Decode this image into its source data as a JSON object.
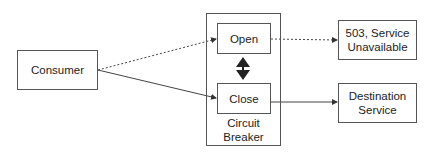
{
  "diagram": {
    "nodes": {
      "consumer": {
        "label": "Consumer"
      },
      "circuit_breaker": {
        "label_line1": "Circuit",
        "label_line2": "Breaker"
      },
      "open": {
        "label": "Open"
      },
      "close": {
        "label": "Close"
      },
      "unavailable": {
        "label_line1": "503, Service",
        "label_line2": "Unavailable"
      },
      "destination": {
        "label_line1": "Destination",
        "label_line2": "Service"
      }
    },
    "edges": [
      {
        "from": "Consumer",
        "to": "Open",
        "style": "dotted"
      },
      {
        "from": "Consumer",
        "to": "Close",
        "style": "solid"
      },
      {
        "from": "Open",
        "to": "503, Service Unavailable",
        "style": "dotted"
      },
      {
        "from": "Close",
        "to": "Destination Service",
        "style": "solid"
      },
      {
        "from": "Open",
        "to": "Close",
        "style": "bidirectional-bold"
      }
    ],
    "colors": {
      "line": "#444444",
      "border": "#555555",
      "background": "#ffffff"
    }
  }
}
